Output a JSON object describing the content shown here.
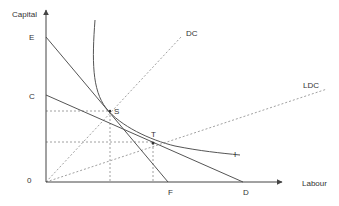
{
  "diagram": {
    "axes": {
      "y_label": "Capital",
      "x_label": "Labour",
      "origin_label": "0"
    },
    "points": {
      "E": "E",
      "C": "C",
      "F": "F",
      "D": "D",
      "S": "S",
      "T": "T"
    },
    "lines": {
      "DC": "DC",
      "LDC": "LDC",
      "isoquant": "I"
    },
    "colors": {
      "axis": "#555555",
      "solid_line": "#555555",
      "dashed_line": "#888888",
      "text": "#333333"
    }
  }
}
